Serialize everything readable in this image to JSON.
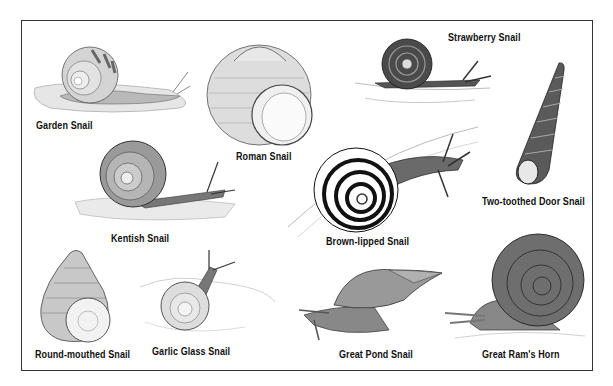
{
  "snails": [
    {
      "id": "garden",
      "name": "Garden Snail"
    },
    {
      "id": "roman",
      "name": "Roman Snail"
    },
    {
      "id": "strawberry",
      "name": "Strawberry Snail"
    },
    {
      "id": "two-toothed-door",
      "name": "Two-toothed Door Snail"
    },
    {
      "id": "kentish",
      "name": "Kentish Snail"
    },
    {
      "id": "brown-lipped",
      "name": "Brown-lipped Snail"
    },
    {
      "id": "round-mouthed",
      "name": "Round-mouthed Snail"
    },
    {
      "id": "garlic-glass",
      "name": "Garlic Glass Snail"
    },
    {
      "id": "great-pond",
      "name": "Great Pond Snail"
    },
    {
      "id": "great-rams-horn",
      "name": "Great Ram's Horn"
    }
  ],
  "colors": {
    "ink": "#222222",
    "shade": "#8a8a8a",
    "light": "#c8c8c8",
    "paper": "#ffffff"
  }
}
